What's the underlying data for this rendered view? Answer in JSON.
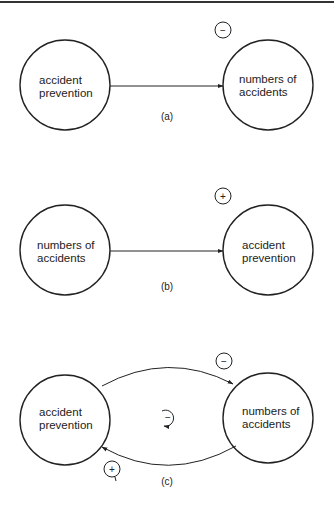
{
  "diagram": {
    "panels": [
      {
        "id": "a",
        "caption": "(a)",
        "left_node": {
          "line1": "accident",
          "line2": "prevention"
        },
        "right_node": {
          "line1": "numbers of",
          "line2": "accidents"
        },
        "link_sign": "−"
      },
      {
        "id": "b",
        "caption": "(b)",
        "left_node": {
          "line1": "numbers of",
          "line2": "accidents"
        },
        "right_node": {
          "line1": "accident",
          "line2": "prevention"
        },
        "link_sign": "+"
      },
      {
        "id": "c",
        "caption": "(c)",
        "left_node": {
          "line1": "accident",
          "line2": "prevention"
        },
        "right_node": {
          "line1": "numbers of",
          "line2": "accidents"
        },
        "top_link_sign": "−",
        "bottom_link_sign": "+",
        "loop_sign": "−"
      }
    ],
    "colors": {
      "line": "#222222",
      "background": "#ffffff"
    }
  }
}
